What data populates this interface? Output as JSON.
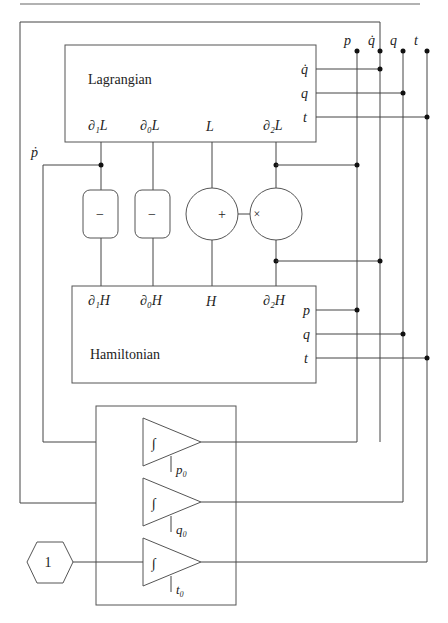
{
  "diagram": {
    "type": "block-diagram",
    "blocks": {
      "lagrangian": {
        "title": "Lagrangian",
        "inputs": [
          "q̇",
          "q",
          "t"
        ],
        "outputs": [
          "∂₁L",
          "∂₀L",
          "L",
          "∂₂L"
        ]
      },
      "hamiltonian": {
        "title": "Hamiltonian",
        "inputs": [
          "∂₁H",
          "∂₀H",
          "H",
          "∂₂H"
        ],
        "outputs": [
          "p",
          "q",
          "t"
        ]
      },
      "operators": [
        {
          "id": "neg1",
          "symbol": "−"
        },
        {
          "id": "neg2",
          "symbol": "−"
        },
        {
          "id": "adder",
          "symbol": "+"
        },
        {
          "id": "multiplier",
          "symbol": "×"
        }
      ],
      "integrators": [
        {
          "symbol": "∫",
          "initial": "p₀"
        },
        {
          "symbol": "∫",
          "initial": "q₀"
        },
        {
          "symbol": "∫",
          "initial": "t₀"
        }
      ],
      "constant": {
        "value": "1"
      }
    },
    "bus_labels": [
      "p",
      "q̇",
      "q",
      "t"
    ],
    "side_labels": {
      "pdot": "ṗ"
    },
    "labels": {
      "L_in_qdot": "q̇",
      "L_in_q": "q",
      "L_in_t": "t",
      "L_out_d1": "∂₁L",
      "L_out_d0": "∂₀L",
      "L_out_L": "L",
      "L_out_d2": "∂₂L",
      "H_in_d1": "∂₁H",
      "H_in_d0": "∂₀H",
      "H_in_H": "H",
      "H_in_d2": "∂₂H",
      "H_out_p": "p",
      "H_out_q": "q",
      "H_out_t": "t",
      "bus_p": "p",
      "bus_qdot": "q̇",
      "bus_q": "q",
      "bus_t": "t",
      "pdot": "ṗ",
      "neg1": "−",
      "neg2": "−",
      "plus": "+",
      "times": "×",
      "int1": "∫",
      "int2": "∫",
      "int3": "∫",
      "p0": "p₀",
      "q0": "q₀",
      "t0": "t₀",
      "const": "1",
      "lagrangian": "Lagrangian",
      "hamiltonian": "Hamiltonian"
    }
  }
}
